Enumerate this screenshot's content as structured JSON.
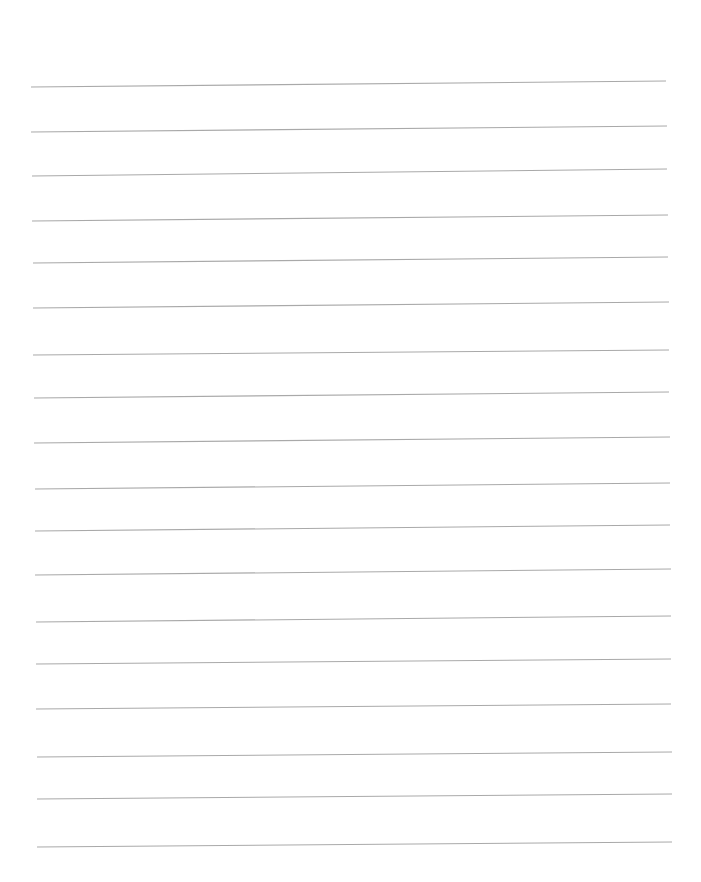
{
  "page": {
    "type": "lined-paper",
    "background": "#ffffff",
    "line_color": "#a9a9a9",
    "line_width": 1.1,
    "lines": [
      {
        "x1": 31,
        "y1": 87,
        "x2": 666,
        "y2": 81
      },
      {
        "x1": 31,
        "y1": 132,
        "x2": 667,
        "y2": 126
      },
      {
        "x1": 32,
        "y1": 176,
        "x2": 667,
        "y2": 169
      },
      {
        "x1": 32,
        "y1": 221,
        "x2": 668,
        "y2": 215
      },
      {
        "x1": 33,
        "y1": 263,
        "x2": 668,
        "y2": 257
      },
      {
        "x1": 33,
        "y1": 308,
        "x2": 669,
        "y2": 302
      },
      {
        "x1": 33,
        "y1": 355,
        "x2": 669,
        "y2": 350
      },
      {
        "x1": 34,
        "y1": 398,
        "x2": 669,
        "y2": 392
      },
      {
        "x1": 34,
        "y1": 443,
        "x2": 670,
        "y2": 437
      },
      {
        "x1": 35,
        "y1": 489,
        "x2": 670,
        "y2": 483
      },
      {
        "x1": 35,
        "y1": 531,
        "x2": 670,
        "y2": 525
      },
      {
        "x1": 35,
        "y1": 575,
        "x2": 671,
        "y2": 569
      },
      {
        "x1": 36,
        "y1": 622,
        "x2": 671,
        "y2": 616
      },
      {
        "x1": 36,
        "y1": 664,
        "x2": 671,
        "y2": 659
      },
      {
        "x1": 36,
        "y1": 709,
        "x2": 671,
        "y2": 704
      },
      {
        "x1": 37,
        "y1": 757,
        "x2": 672,
        "y2": 752
      },
      {
        "x1": 37,
        "y1": 799,
        "x2": 672,
        "y2": 794
      },
      {
        "x1": 37,
        "y1": 847,
        "x2": 672,
        "y2": 842
      }
    ]
  }
}
